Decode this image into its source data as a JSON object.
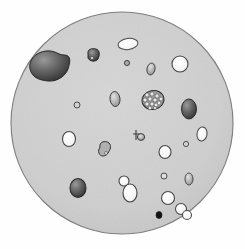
{
  "figure": {
    "canvas": {
      "width": 245,
      "height": 249
    },
    "background_color": "#fefefe"
  },
  "field": {
    "name": "field-of-view-disk",
    "center_x": 122,
    "center_y": 123,
    "radius": 111,
    "fill_color": "#cfcfcf",
    "stroke_color": "#7a7a7a",
    "stroke_width": 1.1
  },
  "palette": {
    "bright_fill": "#f2f2f2",
    "bright_stroke": "#4a4a4a",
    "mid_fill": "#b9b9b9",
    "mid_stroke": "#444444",
    "dark_fill": "#5c5c5c",
    "dark_stroke": "#2a2a2a",
    "black": "#151515",
    "disk_fill": "#cfcfcf",
    "disk_stroke": "#7a7a7a"
  },
  "particles": [
    {
      "id": "large-irregular-mass",
      "kind": "irregular-blob",
      "cx": 47,
      "cy": 66,
      "rx": 22,
      "ry": 15,
      "shade": "dark",
      "label": "Large dark irregular mass"
    },
    {
      "id": "small-dark-blob-upper",
      "kind": "irregular-blob",
      "cx": 93,
      "cy": 55,
      "rx": 6,
      "ry": 6,
      "shade": "dark",
      "label": "Small dark granular blob"
    },
    {
      "id": "bright-oval-top",
      "kind": "oval",
      "cx": 128,
      "cy": 44,
      "rx": 10,
      "ry": 5.5,
      "shade": "bright",
      "label": "Bright elongated vesicle"
    },
    {
      "id": "tiny-dot-upper-mid",
      "kind": "dot",
      "cx": 127,
      "cy": 63,
      "rx": 2.5,
      "ry": 2.5,
      "shade": "mid",
      "label": "Tiny dark dot"
    },
    {
      "id": "oval-upper-right",
      "kind": "oval",
      "cx": 151,
      "cy": 69,
      "rx": 4,
      "ry": 6,
      "shade": "mid",
      "label": "Small grey oval"
    },
    {
      "id": "bright-circle-upper-right",
      "kind": "circle",
      "cx": 180,
      "cy": 64,
      "rx": 8,
      "ry": 8,
      "shade": "bright",
      "label": "Bright round vesicle"
    },
    {
      "id": "oval-mid-upper-left-small",
      "kind": "dot",
      "cx": 77,
      "cy": 105,
      "rx": 3,
      "ry": 3,
      "shade": "mid",
      "label": "Tiny ring"
    },
    {
      "id": "oval-center-left",
      "kind": "oval",
      "cx": 115,
      "cy": 99,
      "rx": 5,
      "ry": 7.5,
      "shade": "mid",
      "label": "Grey oval"
    },
    {
      "id": "berry-cluster",
      "kind": "cluster",
      "cx": 153,
      "cy": 100,
      "rx": 11,
      "ry": 9,
      "shade": "dark",
      "label": "Stippled berry-like cluster"
    },
    {
      "id": "dark-oval-right",
      "kind": "oval",
      "cx": 189,
      "cy": 109,
      "rx": 7.5,
      "ry": 10,
      "shade": "dark",
      "label": "Dark gradient oval"
    },
    {
      "id": "bright-circle-mid-left",
      "kind": "circle",
      "cx": 69,
      "cy": 139,
      "rx": 6.5,
      "ry": 7.5,
      "shade": "bright",
      "label": "Bright vesicle"
    },
    {
      "id": "amoeboid-mid",
      "kind": "irregular-blob",
      "cx": 105,
      "cy": 150,
      "rx": 6,
      "ry": 6,
      "shade": "mid",
      "label": "Irregular amoeboid particle"
    },
    {
      "id": "tadpole-center",
      "kind": "irregular-blob",
      "cx": 139,
      "cy": 135,
      "rx": 4.5,
      "ry": 5,
      "shade": "mid",
      "label": "Small tadpole-shaped particle"
    },
    {
      "id": "bright-oval-right-mid",
      "kind": "oval",
      "cx": 202,
      "cy": 134,
      "rx": 5,
      "ry": 7,
      "shade": "bright",
      "label": "Bright narrow oval"
    },
    {
      "id": "tiny-ring-right",
      "kind": "dot",
      "cx": 186,
      "cy": 144,
      "rx": 2.5,
      "ry": 2.5,
      "shade": "mid",
      "label": "Tiny ring"
    },
    {
      "id": "bright-circle-mid-right",
      "kind": "circle",
      "cx": 165,
      "cy": 152,
      "rx": 6,
      "ry": 6.5,
      "shade": "bright",
      "label": "Bright vesicle"
    },
    {
      "id": "dark-oval-lower-left",
      "kind": "oval",
      "cx": 78,
      "cy": 188,
      "rx": 8,
      "ry": 9.5,
      "shade": "dark",
      "label": "Dark gradient oval"
    },
    {
      "id": "budding-pair-small",
      "kind": "circle",
      "cx": 124,
      "cy": 181,
      "rx": 5,
      "ry": 5,
      "shade": "bright",
      "label": "Bud of budding particle"
    },
    {
      "id": "budding-pair-large",
      "kind": "oval",
      "cx": 130,
      "cy": 193,
      "rx": 7,
      "ry": 9,
      "shade": "bright",
      "label": "Mother cell of budding particle"
    },
    {
      "id": "tiny-ring-lower-mid",
      "kind": "dot",
      "cx": 164,
      "cy": 176,
      "rx": 3,
      "ry": 3,
      "shade": "mid",
      "label": "Tiny ring"
    },
    {
      "id": "oval-lower-right",
      "kind": "oval",
      "cx": 189,
      "cy": 179,
      "rx": 4,
      "ry": 6,
      "shade": "mid",
      "label": "Small grey oval"
    },
    {
      "id": "bright-circle-lower-right",
      "kind": "circle",
      "cx": 168,
      "cy": 198,
      "rx": 6.5,
      "ry": 6.5,
      "shade": "bright",
      "label": "Bright vesicle"
    },
    {
      "id": "black-dot-bottom",
      "kind": "dot",
      "cx": 159,
      "cy": 215,
      "rx": 3,
      "ry": 3.5,
      "shade": "black",
      "label": "Solid black dot"
    },
    {
      "id": "overlap-pair-a",
      "kind": "circle",
      "cx": 181,
      "cy": 209,
      "rx": 5.5,
      "ry": 5.5,
      "shade": "bright",
      "label": "Overlapping vesicle A"
    },
    {
      "id": "overlap-pair-b",
      "kind": "circle",
      "cx": 187,
      "cy": 215,
      "rx": 4.5,
      "ry": 4.5,
      "shade": "bright",
      "label": "Overlapping vesicle B"
    }
  ]
}
